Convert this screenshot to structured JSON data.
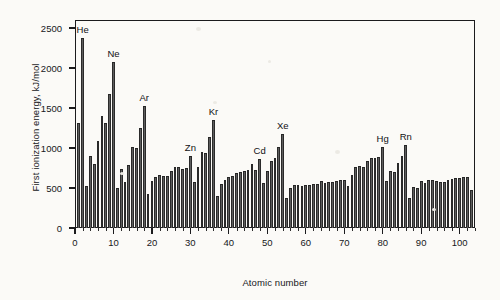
{
  "chart_data": {
    "type": "bar",
    "title": "",
    "xlabel": "Atomic number",
    "ylabel": "First ionization energy, kJ/mol",
    "xlim": [
      0,
      104
    ],
    "ylim": [
      0,
      2600
    ],
    "xticks": [
      0,
      10,
      20,
      30,
      40,
      50,
      60,
      70,
      80,
      90,
      100
    ],
    "yticks": [
      0,
      500,
      1000,
      1500,
      2000,
      2500
    ],
    "grid": false,
    "legend": null,
    "bar_color": "#5d5d5d",
    "background_color": "#fbfaf7",
    "axis_color": "#1b1b1d",
    "x": [
      1,
      2,
      3,
      4,
      5,
      6,
      7,
      8,
      9,
      10,
      11,
      12,
      13,
      14,
      15,
      16,
      17,
      18,
      19,
      20,
      21,
      22,
      23,
      24,
      25,
      26,
      27,
      28,
      29,
      30,
      31,
      32,
      33,
      34,
      35,
      36,
      37,
      38,
      39,
      40,
      41,
      42,
      43,
      44,
      45,
      46,
      47,
      48,
      49,
      50,
      51,
      52,
      53,
      54,
      55,
      56,
      57,
      58,
      59,
      60,
      61,
      62,
      63,
      64,
      65,
      66,
      67,
      68,
      69,
      70,
      71,
      72,
      73,
      74,
      75,
      76,
      77,
      78,
      79,
      80,
      81,
      82,
      83,
      84,
      85,
      86,
      87,
      88,
      89,
      90,
      91,
      92,
      93,
      94,
      95,
      96,
      97,
      98,
      99,
      100,
      101,
      102,
      103
    ],
    "values": [
      1312,
      2372,
      520,
      900,
      801,
      1086,
      1402,
      1314,
      1681,
      2081,
      496,
      738,
      578,
      787,
      1012,
      1000,
      1251,
      1521,
      419,
      590,
      633,
      659,
      651,
      653,
      717,
      763,
      760,
      737,
      746,
      906,
      579,
      762,
      947,
      941,
      1140,
      1351,
      403,
      550,
      600,
      640,
      652,
      684,
      702,
      710,
      720,
      804,
      731,
      868,
      558,
      709,
      834,
      869,
      1008,
      1170,
      376,
      503,
      538,
      534,
      527,
      533,
      540,
      545,
      547,
      593,
      566,
      573,
      581,
      589,
      597,
      603,
      524,
      659,
      761,
      770,
      760,
      840,
      880,
      870,
      890,
      1007,
      589,
      716,
      703,
      812,
      899,
      1037,
      380,
      509,
      499,
      587,
      568,
      598,
      605,
      585,
      578,
      581,
      601,
      608,
      619,
      627,
      635,
      642,
      470
    ],
    "annotations": [
      {
        "label": "He",
        "x": 2,
        "y": 2372
      },
      {
        "label": "Ne",
        "x": 10,
        "y": 2081
      },
      {
        "label": "Ar",
        "x": 18,
        "y": 1521
      },
      {
        "label": "Zn",
        "x": 30,
        "y": 906
      },
      {
        "label": "Kr",
        "x": 36,
        "y": 1351
      },
      {
        "label": "Cd",
        "x": 48,
        "y": 868
      },
      {
        "label": "Xe",
        "x": 54,
        "y": 1170
      },
      {
        "label": "Hg",
        "x": 80,
        "y": 1007
      },
      {
        "label": "Rn",
        "x": 86,
        "y": 1037
      }
    ]
  }
}
